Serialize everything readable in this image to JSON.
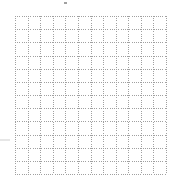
{
  "diagram": {
    "type": "dotted-grid",
    "columns": 12,
    "rows": 12,
    "line_color": "#a0a0a0",
    "line_style": "dotted",
    "background": "#ffffff"
  }
}
